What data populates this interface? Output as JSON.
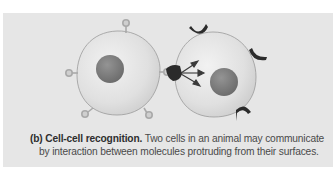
{
  "figure": {
    "panel_label": "(b)",
    "title": "Cell-cell recognition.",
    "caption_line1": "Two cells in an animal may communicate",
    "caption_line2": "by interaction between molecules protruding from their surfaces.",
    "cells": [
      {
        "name": "left-cell",
        "marker_type": "knob-receptor",
        "marker_count": 5
      },
      {
        "name": "right-cell",
        "marker_type": "cup-receptor",
        "marker_count": 4
      }
    ],
    "signal_arrows": 3
  },
  "colors": {
    "panel_bg": "#e6e6e6",
    "cell_fill": "#e2e2e2",
    "nucleus": "#7d7d7d",
    "dark_receptor": "#2b2b2b",
    "knob": "#b5b5b5"
  }
}
